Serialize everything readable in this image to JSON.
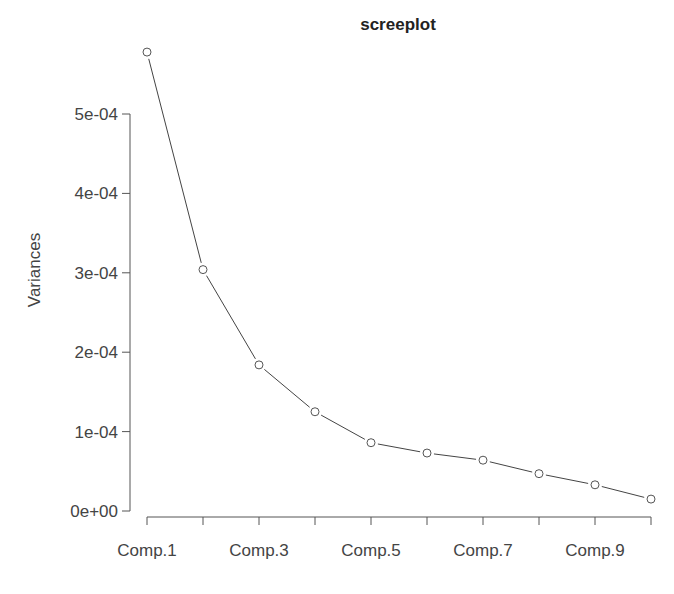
{
  "chart_data": {
    "type": "line",
    "title": "screeplot",
    "xlabel": "",
    "ylabel": "Variances",
    "categories": [
      "Comp.1",
      "Comp.2",
      "Comp.3",
      "Comp.4",
      "Comp.5",
      "Comp.6",
      "Comp.7",
      "Comp.8",
      "Comp.9",
      "Comp.10"
    ],
    "x_tick_labels_shown": [
      "Comp.1",
      "Comp.3",
      "Comp.5",
      "Comp.7",
      "Comp.9"
    ],
    "series": [
      {
        "name": "Variances",
        "values": [
          0.000578,
          0.000304,
          0.000184,
          0.000125,
          8.6e-05,
          7.3e-05,
          6.4e-05,
          4.7e-05,
          3.3e-05,
          1.5e-05
        ]
      }
    ],
    "y_ticks": [
      0,
      0.0001,
      0.0002,
      0.0003,
      0.0004,
      0.0005
    ],
    "y_tick_labels": [
      "0e+00",
      "1e-04",
      "2e-04",
      "3e-04",
      "4e-04",
      "5e-04"
    ],
    "ylim": [
      0,
      0.0005
    ],
    "grid": false,
    "legend": "none",
    "marker": "open-circle"
  }
}
